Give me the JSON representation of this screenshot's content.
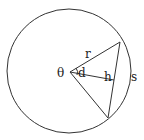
{
  "diagram": {
    "type": "circle-segment-geometry",
    "colors": {
      "stroke": "#333333",
      "background": "#ffffff",
      "text": "#222222"
    },
    "circle": {
      "cx": 69,
      "cy": 71,
      "r": 62
    },
    "center": {
      "x": 70,
      "y": 72
    },
    "chord_endpoints": {
      "upper": {
        "x": 120,
        "y": 42
      },
      "lower": {
        "x": 108,
        "y": 118
      }
    },
    "labels": {
      "radius": "r",
      "angle": "θ",
      "apothem": "d",
      "chord": "h",
      "arc": "s"
    }
  }
}
